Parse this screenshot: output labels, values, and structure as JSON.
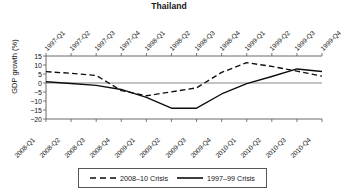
{
  "chart_data": {
    "type": "line",
    "title": "Thailand",
    "xlabel": "",
    "ylabel": "GDP growth (%)",
    "ylim": [
      -20,
      15
    ],
    "yticks": [
      15,
      10,
      5,
      0,
      -5,
      -10,
      -15,
      -20
    ],
    "ytick_labels": [
      "15",
      "10",
      "5",
      "0",
      "−5",
      "−10",
      "−15",
      "−20"
    ],
    "grid": false,
    "legend_position": "bottom",
    "top_axis_label": "1997–99 quarters",
    "bottom_axis_label": "2008–10 quarters",
    "x_top": [
      "1997-Q1",
      "1997-Q2",
      "1997-Q3",
      "1997-Q4",
      "1998-Q1",
      "1998-Q2",
      "1998-Q3",
      "1998-Q4",
      "1999-Q1",
      "1999-Q2",
      "1999-Q3",
      "1999-Q4"
    ],
    "x_bottom": [
      "2008-Q1",
      "2008-Q2",
      "2008-Q3",
      "2008-Q4",
      "2009-Q1",
      "2009-Q2",
      "2009-Q3",
      "2009-Q4",
      "2010-Q1",
      "2010-Q2",
      "2010-Q3",
      "2010-Q4"
    ],
    "series": [
      {
        "name": "2008–10 Crisis",
        "style": "dashed",
        "axis": "bottom",
        "values": [
          6.3,
          5.4,
          4.2,
          -4.2,
          -7.1,
          -4.9,
          -2.7,
          5.9,
          11.3,
          9.2,
          6.6,
          3.8
        ]
      },
      {
        "name": "1997–99 Crisis",
        "style": "solid",
        "axis": "top",
        "values": [
          0.7,
          -0.3,
          -1.3,
          -3.6,
          -8.0,
          -14.0,
          -14.0,
          -6.1,
          -0.4,
          3.6,
          7.8,
          6.4
        ]
      }
    ]
  },
  "legend": {
    "entries": [
      {
        "label": "2008–10 Crisis",
        "style": "dashed"
      },
      {
        "label": "1997–99 Crisis",
        "style": "solid"
      }
    ]
  },
  "colors": {
    "line": "#0d0d0d",
    "axis": "#5a5a5a",
    "zero_line": "#8a8a8a",
    "text": "#141414",
    "background": "#ffffff"
  }
}
